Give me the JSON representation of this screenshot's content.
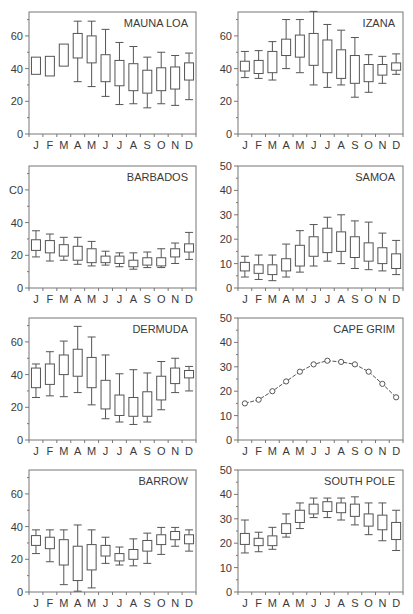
{
  "months": [
    "J",
    "F",
    "M",
    "A",
    "M",
    "J",
    "J",
    "A",
    "S",
    "O",
    "N",
    "D"
  ],
  "colors": {
    "line": "#555555",
    "text": "#3a3a3a",
    "background": "#ffffff"
  },
  "chart_data": [
    {
      "type": "box",
      "title": "MAUNA LOA",
      "ylim": [
        0,
        75
      ],
      "yticks": [
        0,
        20,
        40,
        60
      ],
      "ytick_labels": [
        "0",
        "20",
        "40",
        "60"
      ],
      "categories": [
        "J",
        "F",
        "M",
        "A",
        "M",
        "J",
        "J",
        "A",
        "S",
        "O",
        "N",
        "D"
      ],
      "boxes": [
        {
          "min": null,
          "q1": 36.5,
          "q3": 47,
          "max": null
        },
        {
          "min": null,
          "q1": 35.5,
          "q3": 47.5,
          "max": null
        },
        {
          "min": null,
          "q1": 41.5,
          "q3": 55,
          "max": null
        },
        {
          "min": 32,
          "q1": 46.5,
          "q3": 61.5,
          "max": 69
        },
        {
          "min": 29,
          "q1": 43.5,
          "q3": 60,
          "max": 69
        },
        {
          "min": 23,
          "q1": 32,
          "q3": 48.5,
          "max": 64
        },
        {
          "min": 18,
          "q1": 29.5,
          "q3": 45,
          "max": 56
        },
        {
          "min": 18.5,
          "q1": 26.5,
          "q3": 43,
          "max": 53.5
        },
        {
          "min": 16,
          "q1": 25,
          "q3": 39,
          "max": 47
        },
        {
          "min": 18.5,
          "q1": 26.5,
          "q3": 40.5,
          "max": 50
        },
        {
          "min": 17.5,
          "q1": 27.5,
          "q3": 41,
          "max": 48
        },
        {
          "min": 21,
          "q1": 33,
          "q3": 43.5,
          "max": 49.5
        }
      ]
    },
    {
      "type": "box",
      "title": "IZANA",
      "ylim": [
        0,
        75
      ],
      "yticks": [
        0,
        20,
        40,
        60
      ],
      "ytick_labels": [
        "0",
        "20",
        "40",
        "60"
      ],
      "categories": [
        "J",
        "F",
        "M",
        "A",
        "M",
        "J",
        "J",
        "A",
        "S",
        "O",
        "N",
        "D"
      ],
      "boxes": [
        {
          "min": 34.5,
          "q1": 38.5,
          "q3": 44.5,
          "max": 50.5
        },
        {
          "min": 34,
          "q1": 37,
          "q3": 45,
          "max": 51
        },
        {
          "min": 33,
          "q1": 37.5,
          "q3": 50.5,
          "max": 56.5
        },
        {
          "min": 40,
          "q1": 48,
          "q3": 58,
          "max": 70
        },
        {
          "min": 37.5,
          "q1": 47,
          "q3": 60.5,
          "max": 70
        },
        {
          "min": 30,
          "q1": 42,
          "q3": 61.5,
          "max": 75
        },
        {
          "min": 28.5,
          "q1": 37.5,
          "q3": 57.5,
          "max": 67
        },
        {
          "min": 30,
          "q1": 34,
          "q3": 51.5,
          "max": 63.5
        },
        {
          "min": 22.5,
          "q1": 31,
          "q3": 48,
          "max": 59
        },
        {
          "min": 25.5,
          "q1": 32,
          "q3": 42.5,
          "max": 48.5
        },
        {
          "min": 31,
          "q1": 36,
          "q3": 42.5,
          "max": 47.5
        },
        {
          "min": 36.5,
          "q1": 39,
          "q3": 43.5,
          "max": 49
        }
      ]
    },
    {
      "type": "box",
      "title": "BARBADOS",
      "ylim": [
        0,
        75
      ],
      "yticks": [
        0,
        20,
        40,
        60
      ],
      "ytick_labels": [
        "0",
        "20",
        "40",
        "C0"
      ],
      "categories": [
        "J",
        "F",
        "M",
        "A",
        "M",
        "J",
        "J",
        "A",
        "S",
        "O",
        "N",
        "D"
      ],
      "boxes": [
        {
          "min": 19,
          "q1": 23,
          "q3": 29.5,
          "max": 35
        },
        {
          "min": 16.5,
          "q1": 21.5,
          "q3": 29,
          "max": 33
        },
        {
          "min": 17,
          "q1": 19.5,
          "q3": 26.5,
          "max": 31
        },
        {
          "min": 14.5,
          "q1": 17,
          "q3": 25.5,
          "max": 31
        },
        {
          "min": 13.5,
          "q1": 15.5,
          "q3": 24,
          "max": 28.5
        },
        {
          "min": 14,
          "q1": 15.5,
          "q3": 19.5,
          "max": 22.5
        },
        {
          "min": 13,
          "q1": 15,
          "q3": 19.5,
          "max": 21.5
        },
        {
          "min": 11.5,
          "q1": 13,
          "q3": 17,
          "max": 21.5
        },
        {
          "min": 12.5,
          "q1": 14,
          "q3": 18.5,
          "max": 22
        },
        {
          "min": 12.5,
          "q1": 13.5,
          "q3": 18.5,
          "max": 24
        },
        {
          "min": 15,
          "q1": 19,
          "q3": 24,
          "max": 27.5
        },
        {
          "min": 17.5,
          "q1": 22,
          "q3": 27,
          "max": 34
        }
      ]
    },
    {
      "type": "box",
      "title": "SAMOA",
      "ylim": [
        0,
        50
      ],
      "yticks": [
        0,
        10,
        20,
        30,
        40,
        50
      ],
      "ytick_labels": [
        "0",
        "10",
        "20",
        "30",
        "40",
        "50"
      ],
      "categories": [
        "J",
        "F",
        "M",
        "A",
        "M",
        "J",
        "J",
        "A",
        "S",
        "O",
        "N",
        "D"
      ],
      "boxes": [
        {
          "min": 4.5,
          "q1": 7,
          "q3": 10.5,
          "max": 13
        },
        {
          "min": 3.5,
          "q1": 6,
          "q3": 9.5,
          "max": 13.5
        },
        {
          "min": 3,
          "q1": 5.5,
          "q3": 9.5,
          "max": 13.5
        },
        {
          "min": 4.5,
          "q1": 7,
          "q3": 12,
          "max": 18
        },
        {
          "min": 6.5,
          "q1": 9,
          "q3": 17.5,
          "max": 23.5
        },
        {
          "min": 9,
          "q1": 13,
          "q3": 21,
          "max": 26
        },
        {
          "min": 11,
          "q1": 14.5,
          "q3": 24.5,
          "max": 29
        },
        {
          "min": 10,
          "q1": 15,
          "q3": 23,
          "max": 30
        },
        {
          "min": 8,
          "q1": 12.5,
          "q3": 21,
          "max": 27.5
        },
        {
          "min": 7.5,
          "q1": 11,
          "q3": 18.5,
          "max": 27
        },
        {
          "min": 7,
          "q1": 10,
          "q3": 16.5,
          "max": 22.5
        },
        {
          "min": 5.5,
          "q1": 8,
          "q3": 14,
          "max": 19.5
        }
      ]
    },
    {
      "type": "box",
      "title": "DERMUDA",
      "ylim": [
        0,
        75
      ],
      "yticks": [
        0,
        20,
        40,
        60
      ],
      "ytick_labels": [
        "0",
        "20",
        "40",
        "60"
      ],
      "categories": [
        "J",
        "F",
        "M",
        "A",
        "M",
        "J",
        "J",
        "A",
        "S",
        "O",
        "N",
        "D"
      ],
      "boxes": [
        {
          "min": 26,
          "q1": 32,
          "q3": 44,
          "max": 46.5
        },
        {
          "min": 27,
          "q1": 34,
          "q3": 46.5,
          "max": 54
        },
        {
          "min": 26.5,
          "q1": 40,
          "q3": 52,
          "max": 60.5
        },
        {
          "min": 29,
          "q1": 39,
          "q3": 55.5,
          "max": 69.5
        },
        {
          "min": 21.5,
          "q1": 32,
          "q3": 50.5,
          "max": 63
        },
        {
          "min": 13,
          "q1": 19,
          "q3": 36.5,
          "max": 52
        },
        {
          "min": 11,
          "q1": 15,
          "q3": 27.5,
          "max": 40.5
        },
        {
          "min": 9.5,
          "q1": 14.5,
          "q3": 26,
          "max": 43
        },
        {
          "min": 11,
          "q1": 14.5,
          "q3": 29.5,
          "max": 41
        },
        {
          "min": 18.5,
          "q1": 24.5,
          "q3": 39,
          "max": 48
        },
        {
          "min": 29,
          "q1": 34.5,
          "q3": 44,
          "max": 50
        },
        {
          "min": 30,
          "q1": 38,
          "q3": 42.5,
          "max": 45
        }
      ]
    },
    {
      "type": "line",
      "title": "CAPE GRIM",
      "ylim": [
        0,
        50
      ],
      "yticks": [
        0,
        10,
        20,
        30,
        40,
        50
      ],
      "ytick_labels": [
        "0",
        "10",
        "20",
        "30",
        "40",
        "50"
      ],
      "categories": [
        "J",
        "F",
        "M",
        "A",
        "M",
        "J",
        "J",
        "A",
        "S",
        "O",
        "N",
        "D"
      ],
      "values": [
        15,
        16.5,
        20,
        24,
        28,
        31,
        32.5,
        32,
        31,
        28,
        23,
        17.5
      ],
      "marker": "open-circle"
    },
    {
      "type": "box",
      "title": "BARROW",
      "ylim": [
        0,
        75
      ],
      "yticks": [
        0,
        20,
        40,
        60
      ],
      "ytick_labels": [
        "0",
        "20",
        "40",
        "60"
      ],
      "categories": [
        "J",
        "F",
        "M",
        "A",
        "M",
        "J",
        "J",
        "A",
        "S",
        "O",
        "N",
        "D"
      ],
      "boxes": [
        {
          "min": 23.5,
          "q1": 28.5,
          "q3": 34.5,
          "max": 38
        },
        {
          "min": 18.5,
          "q1": 26.5,
          "q3": 33.5,
          "max": 38
        },
        {
          "min": 4.5,
          "q1": 16.5,
          "q3": 32,
          "max": 38
        },
        {
          "min": 0.5,
          "q1": 7,
          "q3": 28,
          "max": 41
        },
        {
          "min": 2.5,
          "q1": 13.5,
          "q3": 29,
          "max": 38
        },
        {
          "min": 17.5,
          "q1": 22,
          "q3": 28.5,
          "max": 33.5
        },
        {
          "min": 16.5,
          "q1": 19,
          "q3": 23.5,
          "max": 27.5
        },
        {
          "min": 16,
          "q1": 20,
          "q3": 26,
          "max": 32.5
        },
        {
          "min": 17.5,
          "q1": 25,
          "q3": 31.5,
          "max": 36
        },
        {
          "min": 23,
          "q1": 29,
          "q3": 35,
          "max": 39.5
        },
        {
          "min": 28,
          "q1": 32,
          "q3": 37,
          "max": 39.5
        },
        {
          "min": 25,
          "q1": 29.5,
          "q3": 35,
          "max": 38
        }
      ]
    },
    {
      "type": "box",
      "title": "SOUTH POLE",
      "ylim": [
        0,
        50
      ],
      "yticks": [
        0,
        10,
        20,
        30,
        40,
        50
      ],
      "ytick_labels": [
        "0",
        "10",
        "20",
        "30",
        "40",
        "50"
      ],
      "categories": [
        "J",
        "F",
        "M",
        "A",
        "M",
        "J",
        "J",
        "A",
        "S",
        "O",
        "N",
        "D"
      ],
      "boxes": [
        {
          "min": 16,
          "q1": 19.5,
          "q3": 24,
          "max": 29.5
        },
        {
          "min": 16.5,
          "q1": 19,
          "q3": 22,
          "max": 24.5
        },
        {
          "min": 17.5,
          "q1": 19,
          "q3": 23,
          "max": 26.5
        },
        {
          "min": 22.5,
          "q1": 24,
          "q3": 28,
          "max": 32
        },
        {
          "min": 26,
          "q1": 28.5,
          "q3": 33.5,
          "max": 36.5
        },
        {
          "min": 30.5,
          "q1": 32,
          "q3": 36,
          "max": 38.5
        },
        {
          "min": 30.5,
          "q1": 33,
          "q3": 37,
          "max": 38.5
        },
        {
          "min": 29.5,
          "q1": 32.5,
          "q3": 36.5,
          "max": 38.5
        },
        {
          "min": 27.5,
          "q1": 31,
          "q3": 36,
          "max": 39
        },
        {
          "min": 23.5,
          "q1": 27,
          "q3": 32,
          "max": 36.5
        },
        {
          "min": 21,
          "q1": 25.5,
          "q3": 31.5,
          "max": 36.5
        },
        {
          "min": 17,
          "q1": 21.5,
          "q3": 28.5,
          "max": 33.5
        }
      ]
    }
  ]
}
